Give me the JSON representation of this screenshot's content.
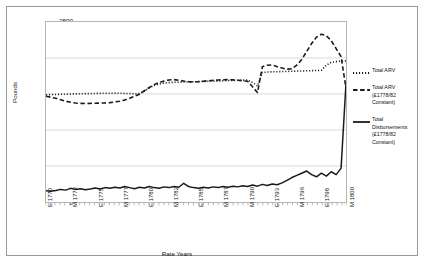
{
  "chart_data": {
    "type": "line",
    "title": "",
    "xlabel": "Rate Years",
    "ylabel": "Pounds",
    "ylim": [
      0,
      2500
    ],
    "yticks": [
      0,
      500,
      1000,
      1500,
      2000,
      2500
    ],
    "grid": true,
    "legend_position": "right-outside",
    "xtick_labels": [
      "E 1770",
      "M 1772",
      "E 1775",
      "M 1777",
      "E 1780",
      "M 1782",
      "E 1785",
      "M 1787",
      "M 1790",
      "E 1793",
      "M 1796",
      "E 1798",
      "M 1800"
    ],
    "x_index": [
      0,
      1,
      2,
      3,
      4,
      5,
      6,
      7,
      8,
      9,
      10,
      11,
      12,
      13,
      14,
      15,
      16,
      17,
      18,
      19,
      20,
      21,
      22,
      23,
      24,
      25,
      26,
      27,
      28,
      29,
      30,
      31,
      32,
      33,
      34,
      35,
      36,
      37,
      38,
      39,
      40,
      41,
      42,
      43,
      44,
      45,
      46,
      47,
      48,
      49,
      50,
      51,
      52,
      53,
      54,
      55,
      56,
      57,
      58,
      59,
      60,
      61
    ],
    "series": [
      {
        "name": "Total ARV",
        "style": "dotted",
        "values": [
          1490,
          1492,
          1494,
          1496,
          1498,
          1500,
          1502,
          1503,
          1505,
          1506,
          1508,
          1509,
          1510,
          1511,
          1512,
          1510,
          1508,
          1506,
          1504,
          1505,
          1540,
          1585,
          1620,
          1640,
          1652,
          1658,
          1662,
          1664,
          1666,
          1668,
          1670,
          1672,
          1674,
          1676,
          1678,
          1680,
          1683,
          1686,
          1688,
          1690,
          1692,
          1694,
          1660,
          1610,
          1800,
          1805,
          1808,
          1810,
          1812,
          1814,
          1816,
          1818,
          1820,
          1822,
          1824,
          1826,
          1830,
          1900,
          1940,
          1950,
          1955,
          1960
        ]
      },
      {
        "name": "Total ARV (£1778/82 Constant)",
        "style": "dashed",
        "values": [
          1470,
          1455,
          1440,
          1420,
          1400,
          1385,
          1375,
          1370,
          1368,
          1370,
          1372,
          1374,
          1376,
          1380,
          1390,
          1400,
          1415,
          1440,
          1470,
          1495,
          1545,
          1590,
          1630,
          1660,
          1680,
          1695,
          1700,
          1690,
          1680,
          1672,
          1668,
          1672,
          1678,
          1684,
          1690,
          1694,
          1698,
          1700,
          1696,
          1690,
          1684,
          1676,
          1600,
          1520,
          1880,
          1900,
          1905,
          1880,
          1860,
          1845,
          1850,
          1900,
          1980,
          2090,
          2200,
          2290,
          2330,
          2310,
          2240,
          2130,
          2020,
          1580
        ]
      },
      {
        "name": "Total Disbursements (£1778/82 Constant)",
        "style": "solid",
        "values": [
          155,
          150,
          160,
          175,
          165,
          190,
          175,
          185,
          170,
          180,
          195,
          180,
          200,
          190,
          205,
          195,
          215,
          200,
          185,
          205,
          195,
          215,
          200,
          190,
          210,
          200,
          215,
          205,
          260,
          215,
          200,
          190,
          205,
          195,
          210,
          200,
          215,
          205,
          220,
          210,
          225,
          215,
          235,
          220,
          245,
          230,
          250,
          240,
          265,
          300,
          340,
          370,
          400,
          430,
          380,
          350,
          400,
          360,
          420,
          380,
          470,
          1650
        ]
      }
    ]
  },
  "legend": {
    "entries": [
      {
        "label": "Total ARV",
        "sublabel": ""
      },
      {
        "label": "Total ARV",
        "sublabel": "(£1778/82 Constant)"
      },
      {
        "label": "Total Disbursements",
        "sublabel": "(£1778/82 Constant)"
      }
    ]
  }
}
